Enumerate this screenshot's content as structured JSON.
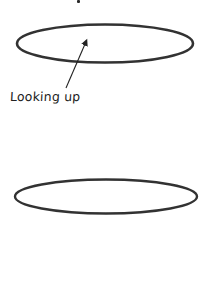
{
  "diagram": {
    "type": "sketch",
    "colors": {
      "background": "#ffffff",
      "stroke": "#333333",
      "axis": "#444444",
      "text": "#222222"
    },
    "annotation": {
      "text": "Looking up",
      "x": 10,
      "y": 89
    },
    "arrow": {
      "from": [
        66,
        88
      ],
      "to": [
        88,
        37
      ]
    },
    "ellipses": [
      {
        "name": "top-ellipse",
        "cx": 105,
        "cy": 43.5,
        "rx": 88,
        "ry": 19
      },
      {
        "name": "bottom-ellipse",
        "cx": 106,
        "cy": 196.5,
        "rx": 91,
        "ry": 17
      }
    ],
    "axis_segments": [
      {
        "x": 104,
        "y1": 40,
        "y2": 180
      },
      {
        "x": 105,
        "y1": 195,
        "y2": 283
      }
    ],
    "top_fragment": {
      "x": 77,
      "y": 0,
      "w": 3,
      "h": 3
    }
  }
}
